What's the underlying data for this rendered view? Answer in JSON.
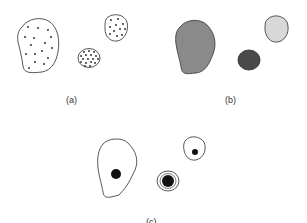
{
  "panels": [
    {
      "id": "a",
      "label": "(a)",
      "description": "cells with scattered dots"
    },
    {
      "id": "b",
      "label": "(b)",
      "description": "cells filled with gray shades"
    },
    {
      "id": "c",
      "label": "(c)",
      "description": "cells with black nucleus"
    }
  ],
  "colors": {
    "outline": "#444444",
    "dot": "#222222",
    "fill_large": "#8a8a8a",
    "fill_small_dark": "#4a4a4a",
    "fill_small_light": "#d8d8d8",
    "nucleus": "#111111"
  }
}
